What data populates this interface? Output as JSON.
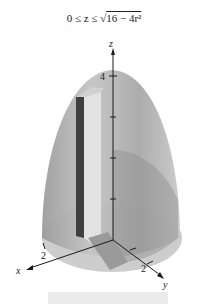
{
  "figure": {
    "title_prefix": "0 ≤ z ≤ ",
    "title_radicand": "16 − 4r²",
    "axes": {
      "z_label": "z",
      "x_label": "x",
      "y_label": "y",
      "z_tick": "4",
      "x_tick": "2",
      "y_tick": "2"
    },
    "colors": {
      "surface": "#b9b9b9",
      "surface_dark": "#8f8f8f",
      "base": "#cfcfcf",
      "cutaway_dark": "#3d3d3d",
      "cutaway_light": "#e2e2e2",
      "axis": "#1a1a1a"
    }
  }
}
